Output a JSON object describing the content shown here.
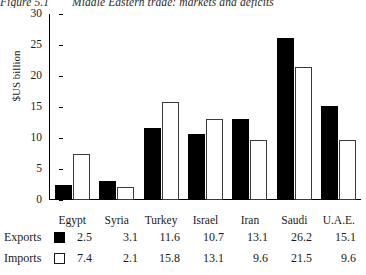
{
  "figure": {
    "number": "Figure 5.1",
    "caption": "Middle Eastern trade: markets and deficits"
  },
  "chart_data": {
    "type": "bar",
    "title": "Middle Eastern trade: markets and deficits",
    "xlabel": "",
    "ylabel": "$US billion",
    "ylim": [
      0,
      30
    ],
    "yticks": [
      0,
      5,
      10,
      15,
      20,
      25,
      30
    ],
    "ytick_labels": [
      "0",
      "5",
      "10",
      "15",
      "20",
      "25",
      "30"
    ],
    "grid": false,
    "legend_position": "bottom-table",
    "categories": [
      "Egypt",
      "Syria",
      "Turkey",
      "Israel",
      "Iran",
      "Saudi",
      "U.A.E."
    ],
    "series": [
      {
        "name": "Exports",
        "color": "#000000",
        "style": "filled",
        "values": [
          2.5,
          3.1,
          11.6,
          10.7,
          13.1,
          26.2,
          15.1
        ]
      },
      {
        "name": "Imports",
        "color": "#ffffff",
        "style": "hollow",
        "values": [
          7.4,
          2.1,
          15.8,
          13.1,
          9.6,
          21.5,
          9.6
        ]
      }
    ]
  },
  "table": {
    "rows": [
      {
        "label": "Exports",
        "swatch": "filled-square-icon",
        "values": [
          "2.5",
          "3.1",
          "11.6",
          "10.7",
          "13.1",
          "26.2",
          "15.1"
        ]
      },
      {
        "label": "Imports",
        "swatch": "hollow-square-icon",
        "values": [
          "7.4",
          "2.1",
          "15.8",
          "13.1",
          "9.6",
          "21.5",
          "9.6"
        ]
      }
    ]
  }
}
